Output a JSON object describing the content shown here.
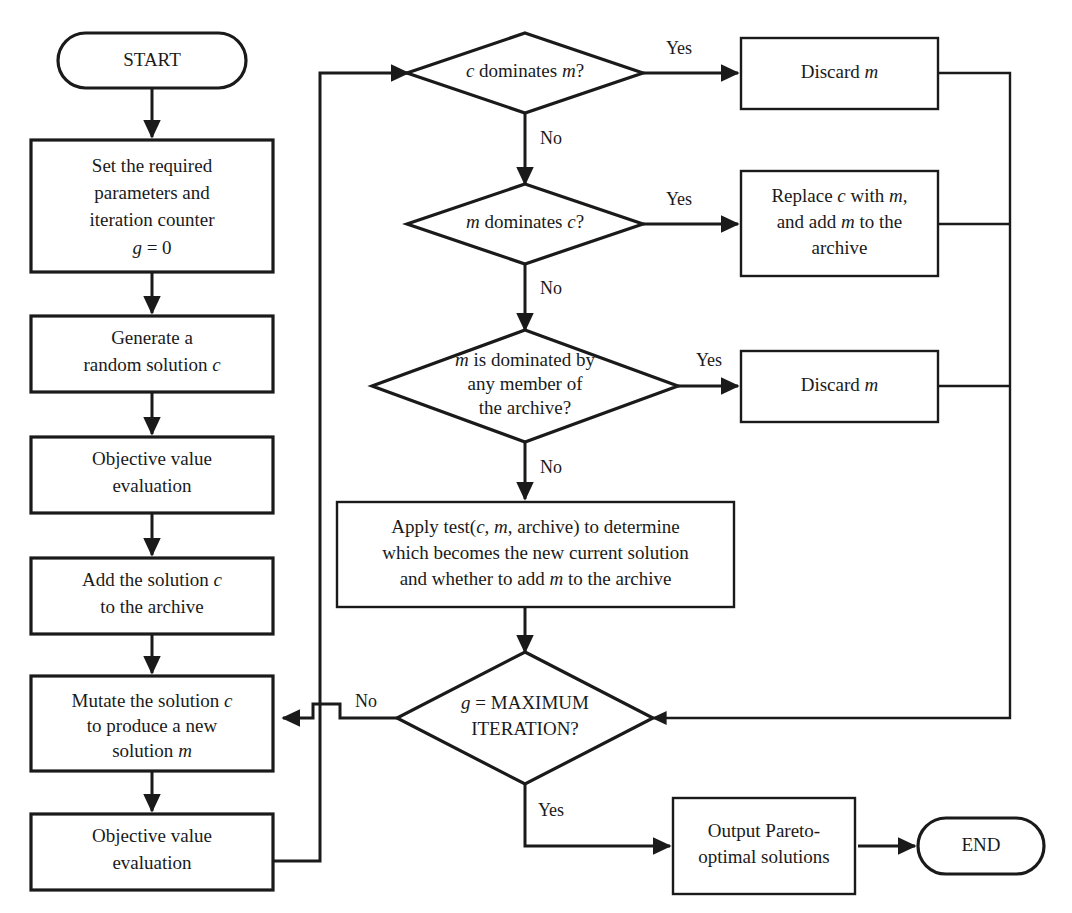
{
  "diagram": {
    "type": "flowchart",
    "colors": {
      "stroke": "#1a1a1a",
      "fill": "#ffffff",
      "background": "#ffffff"
    }
  },
  "nodes": {
    "start": {
      "label": "START",
      "shape": "terminator"
    },
    "set_params": {
      "lines": [
        "Set the required",
        "parameters and",
        "iteration counter",
        "g = 0"
      ],
      "shape": "process"
    },
    "generate": {
      "lines": [
        "Generate a",
        "random solution c"
      ],
      "shape": "process"
    },
    "objective1": {
      "lines": [
        "Objective value",
        "evaluation"
      ],
      "shape": "process"
    },
    "add_solution": {
      "lines": [
        "Add the solution c",
        "to the archive"
      ],
      "shape": "process"
    },
    "mutate": {
      "lines": [
        "Mutate the solution c",
        "to produce a new",
        "solution m"
      ],
      "shape": "process"
    },
    "objective2": {
      "lines": [
        "Objective value",
        "evaluation"
      ],
      "shape": "process"
    },
    "dec_c_dom_m": {
      "lines": [
        "c dominates m?"
      ],
      "shape": "decision"
    },
    "dec_m_dom_c": {
      "lines": [
        "m dominates c?"
      ],
      "shape": "decision"
    },
    "dec_m_dom_archive": {
      "lines": [
        "m is dominated by",
        "any member of",
        "the archive?"
      ],
      "shape": "decision"
    },
    "discard_m_1": {
      "lines": [
        "Discard m"
      ],
      "shape": "process"
    },
    "replace_c": {
      "lines": [
        "Replace c with m,",
        "and add m to the",
        "archive"
      ],
      "shape": "process"
    },
    "discard_m_2": {
      "lines": [
        "Discard m"
      ],
      "shape": "process"
    },
    "apply_test": {
      "lines": [
        "Apply test(c, m, archive) to determine",
        "which becomes the new current solution",
        "and whether to add m to the archive"
      ],
      "shape": "process"
    },
    "dec_max_iter": {
      "lines": [
        "g = MAXIMUM",
        "ITERATION?"
      ],
      "shape": "decision"
    },
    "output_pareto": {
      "lines": [
        "Output Pareto-",
        "optimal solutions"
      ],
      "shape": "process"
    },
    "end": {
      "label": "END",
      "shape": "terminator"
    }
  },
  "edge_labels": {
    "yes_1": "Yes",
    "no_1": "No",
    "yes_2": "Yes",
    "no_2": "No",
    "yes_3": "Yes",
    "no_3": "No",
    "no_loop": "No",
    "yes_end": "Yes"
  }
}
